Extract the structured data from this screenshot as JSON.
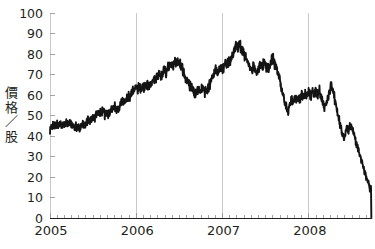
{
  "chart_data": {
    "type": "line",
    "title": "",
    "subtitle": "",
    "xlabel": "",
    "ylabel": "價格／股",
    "ylabel_chars": [
      "價",
      "格",
      "／",
      "股"
    ],
    "xlim": [
      2005.0,
      2008.72
    ],
    "ylim": [
      0,
      100
    ],
    "ytick_values": [
      0,
      10,
      20,
      30,
      40,
      50,
      60,
      70,
      80,
      90,
      100
    ],
    "ytick_labels": [
      "0",
      "10",
      "20",
      "30",
      "40",
      "50",
      "60",
      "70",
      "80",
      "90",
      "100"
    ],
    "xtick_values": [
      2005,
      2006,
      2007,
      2008
    ],
    "xtick_labels": [
      "2005",
      "2006",
      "2007",
      "2008"
    ],
    "minor_xtick_interval_months": 1,
    "grid": "vertical-year-lines-only",
    "legend": "none",
    "line_color": "#141414",
    "gridline_color": "#c9c9c9",
    "axis_color": "#231f20",
    "background_color": "#ffffff",
    "series": [
      {
        "name": "價格／股",
        "x": [
          2005.0,
          2005.02,
          2005.04,
          2005.06,
          2005.08,
          2005.1,
          2005.12,
          2005.14,
          2005.16,
          2005.18,
          2005.2,
          2005.22,
          2005.24,
          2005.26,
          2005.28,
          2005.3,
          2005.32,
          2005.34,
          2005.36,
          2005.38,
          2005.4,
          2005.42,
          2005.44,
          2005.46,
          2005.48,
          2005.5,
          2005.52,
          2005.54,
          2005.56,
          2005.58,
          2005.6,
          2005.62,
          2005.64,
          2005.66,
          2005.68,
          2005.7,
          2005.72,
          2005.74,
          2005.76,
          2005.78,
          2005.8,
          2005.82,
          2005.84,
          2005.86,
          2005.88,
          2005.9,
          2005.92,
          2005.94,
          2005.96,
          2005.98,
          2006.0,
          2006.02,
          2006.04,
          2006.06,
          2006.08,
          2006.1,
          2006.12,
          2006.14,
          2006.16,
          2006.18,
          2006.2,
          2006.22,
          2006.24,
          2006.26,
          2006.28,
          2006.3,
          2006.32,
          2006.34,
          2006.36,
          2006.38,
          2006.4,
          2006.42,
          2006.44,
          2006.46,
          2006.48,
          2006.5,
          2006.52,
          2006.54,
          2006.56,
          2006.58,
          2006.6,
          2006.62,
          2006.64,
          2006.66,
          2006.68,
          2006.7,
          2006.72,
          2006.74,
          2006.76,
          2006.78,
          2006.8,
          2006.82,
          2006.84,
          2006.86,
          2006.88,
          2006.9,
          2006.92,
          2006.94,
          2006.96,
          2006.98,
          2007.0,
          2007.02,
          2007.04,
          2007.06,
          2007.08,
          2007.1,
          2007.12,
          2007.14,
          2007.16,
          2007.18,
          2007.2,
          2007.22,
          2007.24,
          2007.26,
          2007.28,
          2007.3,
          2007.32,
          2007.34,
          2007.36,
          2007.38,
          2007.4,
          2007.42,
          2007.44,
          2007.46,
          2007.48,
          2007.5,
          2007.52,
          2007.54,
          2007.56,
          2007.58,
          2007.6,
          2007.62,
          2007.64,
          2007.66,
          2007.68,
          2007.7,
          2007.72,
          2007.74,
          2007.76,
          2007.78,
          2007.8,
          2007.82,
          2007.84,
          2007.86,
          2007.88,
          2007.9,
          2007.92,
          2007.94,
          2007.96,
          2007.98,
          2008.0,
          2008.02,
          2008.04,
          2008.06,
          2008.08,
          2008.1,
          2008.12,
          2008.14,
          2008.16,
          2008.18,
          2008.2,
          2008.22,
          2008.24,
          2008.26,
          2008.28,
          2008.3,
          2008.32,
          2008.34,
          2008.36,
          2008.38,
          2008.4,
          2008.42,
          2008.44,
          2008.46,
          2008.48,
          2008.5,
          2008.52,
          2008.54,
          2008.56,
          2008.58,
          2008.6,
          2008.62,
          2008.64,
          2008.66,
          2008.68,
          2008.7,
          2008.71,
          2008.72
        ],
        "y": [
          43.0,
          44.5,
          45.5,
          44.8,
          46.0,
          45.2,
          46.3,
          45.4,
          46.5,
          45.6,
          46.8,
          45.8,
          46.2,
          45.0,
          44.2,
          45.0,
          44.0,
          43.6,
          44.8,
          46.0,
          45.2,
          46.5,
          48.0,
          47.2,
          48.5,
          50.0,
          49.2,
          50.5,
          51.5,
          50.8,
          52.0,
          51.0,
          50.2,
          51.3,
          50.4,
          51.5,
          53.0,
          54.5,
          53.6,
          52.8,
          54.0,
          56.0,
          57.5,
          56.6,
          58.0,
          59.5,
          58.6,
          60.0,
          62.0,
          63.0,
          63.5,
          62.8,
          63.6,
          63.0,
          64.2,
          63.4,
          64.5,
          63.8,
          65.0,
          66.5,
          68.0,
          67.0,
          68.5,
          70.0,
          69.0,
          70.5,
          72.0,
          71.0,
          72.5,
          74.0,
          73.0,
          74.5,
          76.0,
          75.0,
          76.5,
          75.5,
          74.0,
          72.0,
          70.0,
          67.5,
          66.0,
          64.5,
          63.5,
          62.0,
          60.5,
          61.5,
          63.0,
          62.0,
          63.5,
          62.5,
          61.5,
          62.5,
          64.0,
          66.0,
          68.0,
          70.0,
          72.0,
          71.0,
          72.5,
          74.0,
          73.0,
          74.5,
          76.0,
          75.0,
          76.5,
          78.0,
          80.0,
          82.0,
          84.5,
          83.0,
          84.0,
          82.0,
          80.0,
          78.5,
          77.0,
          75.0,
          73.5,
          72.0,
          74.0,
          72.5,
          71.0,
          73.0,
          75.0,
          73.5,
          75.5,
          74.0,
          72.5,
          74.0,
          76.0,
          77.5,
          76.0,
          74.0,
          71.0,
          68.0,
          64.0,
          60.0,
          56.5,
          54.0,
          52.0,
          55.0,
          57.5,
          56.0,
          58.5,
          57.0,
          59.0,
          57.5,
          60.0,
          58.5,
          60.5,
          59.0,
          61.0,
          59.5,
          61.5,
          60.0,
          62.0,
          60.5,
          62.5,
          60.0,
          57.0,
          54.0,
          56.0,
          59.0,
          62.0,
          64.5,
          62.0,
          58.0,
          54.0,
          50.0,
          46.0,
          42.0,
          38.5,
          41.0,
          44.5,
          43.0,
          45.5,
          43.5,
          41.0,
          38.0,
          35.0,
          32.0,
          29.0,
          26.0,
          23.0,
          20.5,
          18.0,
          16.0,
          14.0,
          15.5
        ]
      }
    ],
    "annotations": [
      {
        "label": "peak",
        "x": 2007.16,
        "y": 84.5
      },
      {
        "label": "final-collapse-to-zero",
        "x": 2008.72,
        "y": 0.0
      }
    ]
  }
}
